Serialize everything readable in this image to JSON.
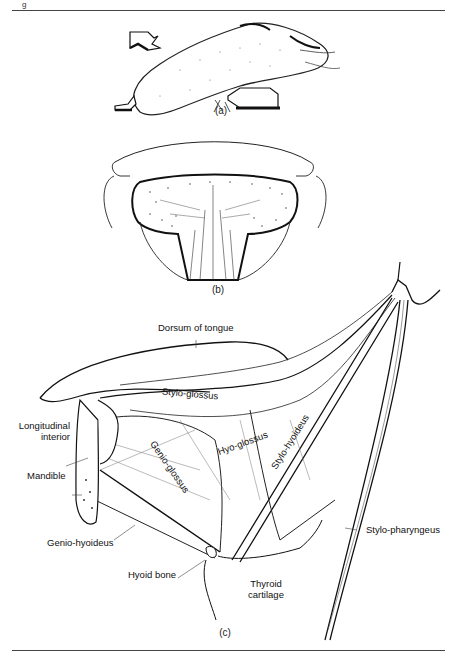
{
  "page": {
    "figure_marker": "g"
  },
  "panels": {
    "a": {
      "caption": "(a)",
      "description": "Tongue lateral view with arrows indicating movement directions"
    },
    "b": {
      "caption": "(b)",
      "description": "Coronal section of tongue"
    },
    "c": {
      "caption": "(c)",
      "description": "Lateral view of extrinsic tongue muscles"
    }
  },
  "labels": {
    "dorsum": "Dorsum of tongue",
    "stylo_glossus": "Stylo-glossus",
    "longitudinal_line1": "Longitudinal",
    "longitudinal_line2": "interior",
    "genio_glossus": "Genio-glossus",
    "hyo_glossus": "Hyo-glossus",
    "stylo_hyoideus": "Stylo-hyoideus",
    "stylo_pharyngeus": "Stylo-pharyngeus",
    "mandible": "Mandible",
    "genio_hyoideus": "Genio-hyoideus",
    "hyoid_bone": "Hyoid bone",
    "thyroid_line1": "Thyroid",
    "thyroid_line2": "cartilage"
  }
}
